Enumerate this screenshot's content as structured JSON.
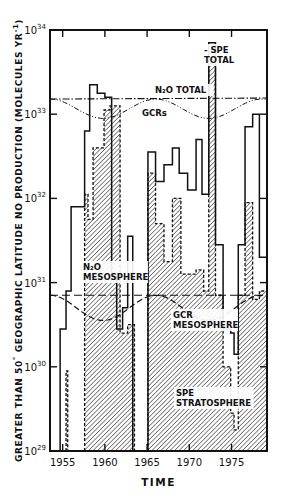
{
  "chart_data": {
    "type": "bar",
    "subtype": "step-histogram (log scale, overlaid)",
    "title": "",
    "xlabel": "TIME",
    "ylabel": "GREATER THAN 50° GEOGRAPHIC LATITUDE NO PRODUCTION (MOLECULES YR⁻¹)",
    "ylabel_parts": {
      "main": "GREATER THAN 50",
      "deg": "°",
      "rest": " GEOGRAPHIC LATITUDE NO PRODUCTION (MOLECULES YR",
      "sup": "-1",
      "end": ")"
    },
    "yscale": "log",
    "ylim": [
      1e+29,
      1e+34
    ],
    "xlim": [
      1953.5,
      1979.2
    ],
    "x_ticks": [
      {
        "value": 1955,
        "label": "1955"
      },
      {
        "value": 1960,
        "label": "1960"
      },
      {
        "value": 1965,
        "label": "1965"
      },
      {
        "value": 1970,
        "label": "1970"
      },
      {
        "value": 1975,
        "label": "1975"
      }
    ],
    "y_ticks": [
      {
        "exp": 29,
        "base": "10",
        "sup": "29"
      },
      {
        "exp": 30,
        "base": "10",
        "sup": "30"
      },
      {
        "exp": 31,
        "base": "10",
        "sup": "31"
      },
      {
        "exp": 32,
        "base": "10",
        "sup": "32"
      },
      {
        "exp": 33,
        "base": "10",
        "sup": "33"
      },
      {
        "exp": 34,
        "base": "10",
        "sup": "34"
      }
    ],
    "grid": false,
    "series": [
      {
        "name": "SPE TOTAL",
        "style": "solid outline",
        "steps_log10": [
          [
            1954.7,
            1955.4,
            30.45
          ],
          [
            1955.4,
            1956.0,
            30.9
          ],
          [
            1956.0,
            1957.6,
            31.9
          ],
          [
            1957.6,
            1958.2,
            32.8
          ],
          [
            1958.2,
            1959.1,
            33.35
          ],
          [
            1959.1,
            1960.0,
            33.25
          ],
          [
            1960.0,
            1960.8,
            33.2
          ],
          [
            1960.8,
            1961.4,
            31.1
          ],
          [
            1961.4,
            1962.1,
            30.45
          ],
          [
            1962.1,
            1962.7,
            30.7
          ],
          [
            1962.7,
            1963.3,
            31.55
          ],
          [
            1965.1,
            1966.0,
            32.55
          ],
          [
            1966.0,
            1967.0,
            32.2
          ],
          [
            1967.0,
            1968.0,
            32.4
          ],
          [
            1968.0,
            1968.8,
            32.6
          ],
          [
            1968.8,
            1969.8,
            32.3
          ],
          [
            1969.8,
            1970.8,
            32.1
          ],
          [
            1970.8,
            1971.5,
            32.7
          ],
          [
            1971.5,
            1972.3,
            32.05
          ],
          [
            1972.3,
            1973.1,
            33.85
          ],
          [
            1973.1,
            1974.0,
            31.45
          ],
          [
            1974.0,
            1974.9,
            30.45
          ],
          [
            1974.9,
            1975.3,
            30.4
          ],
          [
            1975.3,
            1975.8,
            30.15
          ],
          [
            1975.8,
            1976.6,
            31.45
          ],
          [
            1976.6,
            1977.5,
            32.85
          ],
          [
            1977.5,
            1978.3,
            33.0
          ],
          [
            1978.3,
            1979.2,
            31.3
          ]
        ]
      },
      {
        "name": "SPE STRATOSPHERE",
        "style": "hatched fill, dashed top",
        "steps_log10": [
          [
            1955.4,
            1955.6,
            29.95
          ],
          [
            1957.6,
            1958.0,
            32.05
          ],
          [
            1958.0,
            1958.6,
            31.75
          ],
          [
            1958.6,
            1959.9,
            32.6
          ],
          [
            1959.9,
            1960.6,
            33.05
          ],
          [
            1960.6,
            1961.8,
            33.1
          ],
          [
            1961.8,
            1962.7,
            30.4
          ],
          [
            1962.7,
            1963.5,
            30.5
          ],
          [
            1965.1,
            1966.0,
            32.3
          ],
          [
            1966.0,
            1967.0,
            31.7
          ],
          [
            1967.0,
            1968.0,
            31.25
          ],
          [
            1968.0,
            1969.0,
            32.0
          ],
          [
            1969.0,
            1970.8,
            31.1
          ],
          [
            1970.8,
            1971.7,
            31.15
          ],
          [
            1971.7,
            1972.3,
            30.9
          ],
          [
            1972.3,
            1973.1,
            33.6
          ],
          [
            1973.1,
            1974.0,
            30.85
          ],
          [
            1974.0,
            1974.9,
            30.0
          ],
          [
            1974.9,
            1975.3,
            29.45
          ],
          [
            1975.3,
            1975.8,
            29.25
          ],
          [
            1975.8,
            1976.6,
            30.85
          ],
          [
            1976.6,
            1977.5,
            31.95
          ],
          [
            1977.5,
            1978.3,
            30.8
          ],
          [
            1978.3,
            1979.2,
            30.9
          ]
        ]
      }
    ],
    "curves": [
      {
        "name": "N2O TOTAL",
        "style": "dash-dot",
        "approx_log10": 33.18
      },
      {
        "name": "GCRs",
        "style": "dash-dot-dot",
        "min_log10": 32.95,
        "max_log10": 33.2
      },
      {
        "name": "N2O MESOSPHERE",
        "style": "dashed",
        "approx_log10": 30.85
      },
      {
        "name": "GCR MESOSPHERE",
        "style": "dashed",
        "min_log10": 30.55,
        "max_log10": 30.85
      }
    ],
    "annotations": [
      {
        "text_lines": [
          "- SPE",
          "TOTAL"
        ],
        "x": 204,
        "y": 53
      },
      {
        "text_lines": [
          "N₂O TOTAL"
        ],
        "x": 155,
        "y": 93
      },
      {
        "text_lines": [
          "GCRs"
        ],
        "x": 142,
        "y": 116
      },
      {
        "text_lines": [
          "N₂O",
          "MESOSPHERE"
        ],
        "x": 83,
        "y": 270
      },
      {
        "text_lines": [
          "GCR",
          "MESOSPHERE"
        ],
        "x": 173,
        "y": 318
      },
      {
        "text_lines": [
          "SPE",
          "STRATOSPHERE"
        ],
        "x": 176,
        "y": 396
      }
    ]
  }
}
